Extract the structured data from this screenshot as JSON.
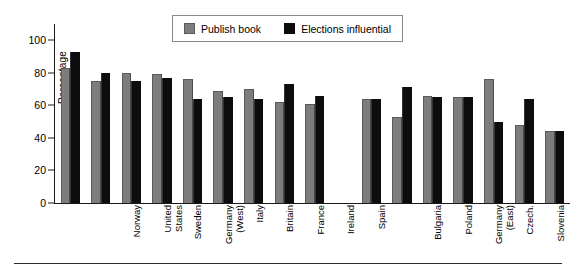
{
  "chart_data": {
    "type": "bar",
    "title": "",
    "subtitle": "",
    "xlabel": "",
    "ylabel": "Percentage",
    "ylim": [
      0,
      110
    ],
    "yticks": [
      0,
      20,
      40,
      60,
      80,
      100
    ],
    "grid": false,
    "legend_position": "top-center",
    "group_gap_after": "Spain",
    "categories": [
      "Norway",
      "United\nStates",
      "Sweden",
      "Germany\n(West)",
      "Italy",
      "Britain",
      "France",
      "Ireland",
      "Spain",
      "Bulgaria",
      "Poland",
      "Germany\n(East)",
      "Czech.",
      "Slovenia",
      "Russia",
      "Hungary"
    ],
    "series": [
      {
        "name": "Publish book",
        "color": "#7d7d7d",
        "values": [
          83,
          75,
          80,
          79,
          76,
          69,
          70,
          62,
          61,
          64,
          53,
          66,
          65,
          76,
          48,
          44
        ]
      },
      {
        "name": "Elections influential",
        "color": "#0d0d0d",
        "values": [
          93,
          80,
          75,
          77,
          64,
          65,
          64,
          73,
          66,
          64,
          71,
          65,
          65,
          50,
          64,
          44
        ]
      }
    ]
  },
  "legend": {
    "items": [
      {
        "label": "Publish book",
        "swatch": "publish"
      },
      {
        "label": "Elections influential",
        "swatch": "elect"
      }
    ]
  },
  "axis": {
    "y_title": "Percentage"
  }
}
